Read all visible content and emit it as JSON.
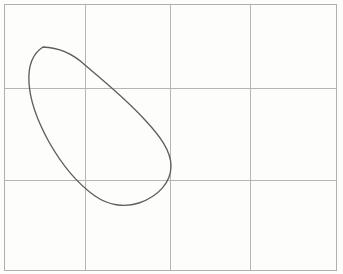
{
  "figure": {
    "title": "",
    "background_color": "#fdfdfc",
    "width": 343,
    "height": 274
  },
  "chart_data": {
    "type": "line",
    "title": "",
    "subtitle": "",
    "xlabel": "",
    "ylabel": "",
    "legend": [],
    "annotations": [],
    "grid": {
      "visible": true,
      "color": "#b5b5b5",
      "border_color": "#b0b0b0",
      "plot_area": {
        "x0": 4,
        "y0": 4,
        "x1": 336,
        "y1": 270
      },
      "vertical_lines_x": [
        85,
        170,
        250
      ],
      "horizontal_lines_y": [
        88,
        180
      ],
      "columns": 4,
      "rows": 3,
      "xticklabels": [],
      "yticklabels": []
    },
    "xlim": [
      4,
      336
    ],
    "ylim": [
      4,
      270
    ],
    "series": [
      {
        "name": "closed-curve",
        "closed": true,
        "color": "#5e5e5e",
        "linewidth": 1.35,
        "extremes": {
          "top": {
            "x": 43,
            "y": 47
          },
          "left": {
            "x": 29,
            "y": 78
          },
          "bottom": {
            "x": 117,
            "y": 205
          },
          "right": {
            "x": 171,
            "y": 163
          }
        },
        "points": [
          {
            "x": 43,
            "y": 47
          },
          {
            "x": 57,
            "y": 49
          },
          {
            "x": 72,
            "y": 56
          },
          {
            "x": 85,
            "y": 66
          },
          {
            "x": 99,
            "y": 76
          },
          {
            "x": 112,
            "y": 86
          },
          {
            "x": 124,
            "y": 96
          },
          {
            "x": 136,
            "y": 108
          },
          {
            "x": 147,
            "y": 121
          },
          {
            "x": 156,
            "y": 133
          },
          {
            "x": 164,
            "y": 146
          },
          {
            "x": 169,
            "y": 157
          },
          {
            "x": 171,
            "y": 166
          },
          {
            "x": 170,
            "y": 176
          },
          {
            "x": 165,
            "y": 186
          },
          {
            "x": 157,
            "y": 194
          },
          {
            "x": 147,
            "y": 200
          },
          {
            "x": 135,
            "y": 204
          },
          {
            "x": 122,
            "y": 205
          },
          {
            "x": 110,
            "y": 203
          },
          {
            "x": 98,
            "y": 198
          },
          {
            "x": 86,
            "y": 190
          },
          {
            "x": 76,
            "y": 181
          },
          {
            "x": 66,
            "y": 170
          },
          {
            "x": 57,
            "y": 157
          },
          {
            "x": 49,
            "y": 143
          },
          {
            "x": 42,
            "y": 128
          },
          {
            "x": 36,
            "y": 112
          },
          {
            "x": 32,
            "y": 97
          },
          {
            "x": 29,
            "y": 83
          },
          {
            "x": 30,
            "y": 69
          },
          {
            "x": 34,
            "y": 56
          },
          {
            "x": 43,
            "y": 47
          }
        ],
        "path_d": "M 43 47 C 58 47.5 72 53 85 65 C 101 79 124 97 145 120 C 160 136 171 151 171 166 C 171 182 159 196 139 203 C 124 208 108 205 95 196 C 78 184 62 165 49 142 C 38 122 30 100 29 83 C 28 67 32 54 43 47 Z"
      }
    ]
  }
}
